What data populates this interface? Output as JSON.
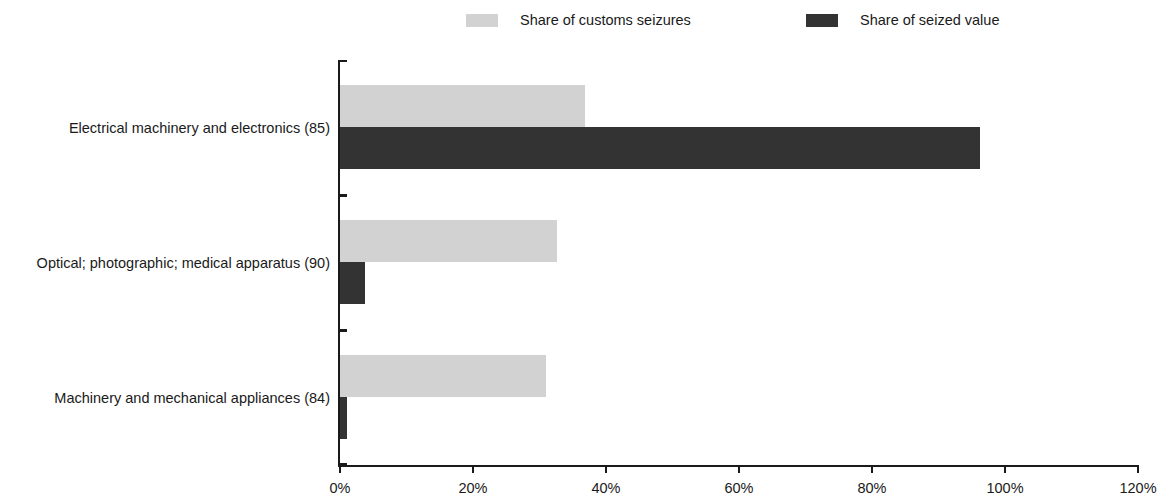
{
  "chart_data": {
    "type": "bar",
    "orientation": "horizontal",
    "title": "",
    "xlabel": "",
    "ylabel": "",
    "xlim": [
      0,
      120
    ],
    "xtick_labels": [
      "0%",
      "20%",
      "40%",
      "60%",
      "80%",
      "100%",
      "120%"
    ],
    "xtick_values": [
      0,
      20,
      40,
      60,
      80,
      100,
      120
    ],
    "grid": false,
    "legend_position": "top",
    "categories": [
      "Electrical machinery and electronics (85)",
      "Optical; photographic; medical apparatus (90)",
      "Machinery and mechanical appliances (84)"
    ],
    "series": [
      {
        "name": "Share of customs seizures",
        "color": "#d2d2d2",
        "values": [
          36.8,
          32.6,
          31.0
        ]
      },
      {
        "name": "Share of seized value",
        "color": "#333333",
        "values": [
          96.2,
          3.8,
          1.0
        ]
      }
    ]
  },
  "legend": {
    "items": [
      {
        "label": "Share of customs seizures",
        "color": "#d2d2d2"
      },
      {
        "label": "Share of seized value",
        "color": "#333333"
      }
    ]
  }
}
